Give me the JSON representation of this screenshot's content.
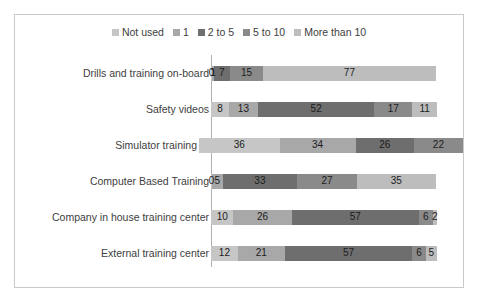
{
  "chart_data": {
    "type": "bar",
    "orientation": "horizontal",
    "stacked": true,
    "title": "",
    "xlabel": "",
    "ylabel": "",
    "grid": false,
    "legend_position": "top-center",
    "categories": [
      "Drills and training on-board",
      "Safety videos",
      "Simulator training",
      "Computer Based Training",
      "Company in house training center",
      "External training center"
    ],
    "series": [
      {
        "name": "Not used",
        "color": "#c6c6c6",
        "values": [
          0,
          8,
          36,
          0,
          10,
          12
        ]
      },
      {
        "name": "1",
        "color": "#a8a8a8",
        "values": [
          1,
          13,
          34,
          5,
          26,
          21
        ]
      },
      {
        "name": "2 to 5",
        "color": "#6e6e6e",
        "values": [
          7,
          52,
          26,
          33,
          57,
          57
        ]
      },
      {
        "name": "5 to 10",
        "color": "#8a8a8a",
        "values": [
          15,
          17,
          22,
          27,
          6,
          6
        ]
      },
      {
        "name": "More than 10",
        "color": "#bdbdbd",
        "values": [
          77,
          11,
          0,
          35,
          2,
          5
        ]
      }
    ],
    "axis_max": 101
  },
  "legend": {
    "items": [
      {
        "label": "Not used"
      },
      {
        "label": "1"
      },
      {
        "label": "2 to 5"
      },
      {
        "label": "5 to 10"
      },
      {
        "label": "More than 10"
      }
    ]
  },
  "rows": [
    {
      "category": "Drills and training on-board",
      "segments": [
        {
          "label": "0",
          "value": 0,
          "color": "#c6c6c6"
        },
        {
          "label": "1",
          "value": 1,
          "color": "#a8a8a8"
        },
        {
          "label": "7",
          "value": 7,
          "color": "#6e6e6e"
        },
        {
          "label": "15",
          "value": 15,
          "color": "#8a8a8a"
        },
        {
          "label": "77",
          "value": 77,
          "color": "#bdbdbd"
        }
      ]
    },
    {
      "category": "Safety videos",
      "segments": [
        {
          "label": "8",
          "value": 8,
          "color": "#c6c6c6"
        },
        {
          "label": "13",
          "value": 13,
          "color": "#a8a8a8"
        },
        {
          "label": "52",
          "value": 52,
          "color": "#6e6e6e"
        },
        {
          "label": "17",
          "value": 17,
          "color": "#8a8a8a"
        },
        {
          "label": "11",
          "value": 11,
          "color": "#bdbdbd"
        }
      ]
    },
    {
      "category": "Simulator training",
      "segments": [
        {
          "label": "36",
          "value": 36,
          "color": "#c6c6c6"
        },
        {
          "label": "34",
          "value": 34,
          "color": "#a8a8a8"
        },
        {
          "label": "26",
          "value": 26,
          "color": "#6e6e6e"
        },
        {
          "label": "22",
          "value": 22,
          "color": "#8a8a8a"
        }
      ]
    },
    {
      "category": "Computer Based Training",
      "segments": [
        {
          "label": "0",
          "value": 0,
          "color": "#c6c6c6"
        },
        {
          "label": "5",
          "value": 5,
          "color": "#a8a8a8"
        },
        {
          "label": "33",
          "value": 33,
          "color": "#6e6e6e"
        },
        {
          "label": "27",
          "value": 27,
          "color": "#8a8a8a"
        },
        {
          "label": "35",
          "value": 35,
          "color": "#bdbdbd"
        }
      ]
    },
    {
      "category": "Company in house training center",
      "segments": [
        {
          "label": "10",
          "value": 10,
          "color": "#c6c6c6"
        },
        {
          "label": "26",
          "value": 26,
          "color": "#a8a8a8"
        },
        {
          "label": "57",
          "value": 57,
          "color": "#6e6e6e"
        },
        {
          "label": "6",
          "value": 6,
          "color": "#8a8a8a"
        },
        {
          "label": "2",
          "value": 2,
          "color": "#bdbdbd"
        }
      ]
    },
    {
      "category": "External training center",
      "segments": [
        {
          "label": "12",
          "value": 12,
          "color": "#c6c6c6"
        },
        {
          "label": "21",
          "value": 21,
          "color": "#a8a8a8"
        },
        {
          "label": "57",
          "value": 57,
          "color": "#6e6e6e"
        },
        {
          "label": "6",
          "value": 6,
          "color": "#8a8a8a"
        },
        {
          "label": "5",
          "value": 5,
          "color": "#bdbdbd"
        }
      ]
    }
  ]
}
